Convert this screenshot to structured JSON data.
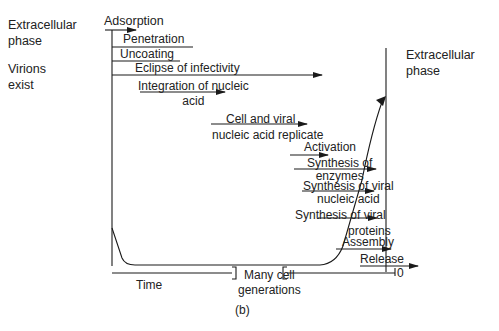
{
  "side_labels": {
    "extracellular_left": [
      "Extracellular",
      "phase"
    ],
    "virions_exist": [
      "Virions",
      "exist"
    ],
    "extracellular_right": [
      "Extracellular",
      "phase"
    ]
  },
  "stages": [
    {
      "label": "Adsorption"
    },
    {
      "label": "Penetration"
    },
    {
      "label": "Uncoating"
    },
    {
      "label": "Eclipse of infectivity"
    },
    {
      "label": [
        "Integration of nucleic",
        "acid"
      ]
    },
    {
      "label": [
        "Cell and viral",
        "nucleic acid replicate"
      ]
    },
    {
      "label": "Activation"
    },
    {
      "label": [
        "Synthesis of",
        "enzymes"
      ]
    },
    {
      "label": [
        "Synthesis of viral",
        "nucleic acid"
      ]
    },
    {
      "label": [
        "Synthesis of viral",
        "proteins"
      ]
    },
    {
      "label": "Assembly"
    },
    {
      "label": "Release"
    }
  ],
  "axis": {
    "time_label": "Time",
    "break_label": [
      "Many cell",
      "generations"
    ],
    "end_label": "0"
  },
  "caption": "(b)"
}
